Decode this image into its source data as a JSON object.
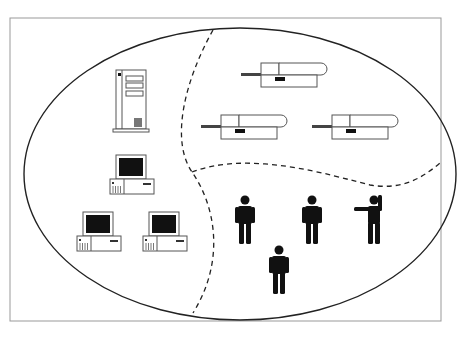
{
  "diagram": {
    "type": "network-zones",
    "colors": {
      "line": "#222222",
      "frame": "#888888",
      "fill": "#111111",
      "bg": "#ffffff"
    },
    "zones": [
      {
        "name": "computers",
        "items": [
          "server-tower",
          "desktop-pc",
          "desktop-pc",
          "desktop-pc"
        ]
      },
      {
        "name": "printers",
        "items": [
          "printer",
          "printer",
          "printer"
        ]
      },
      {
        "name": "users",
        "items": [
          "person",
          "person",
          "person-waving",
          "person"
        ]
      }
    ]
  }
}
